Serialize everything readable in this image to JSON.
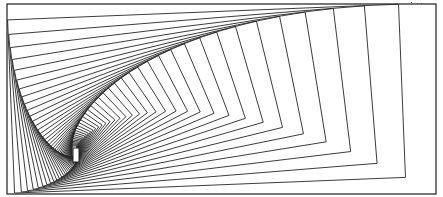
{
  "figure": {
    "canvas": {
      "width": 443,
      "height": 197,
      "background": "#ffffff"
    },
    "stroke_color": "#262626",
    "outer_rectangle": {
      "x1": 7,
      "y1": 4,
      "x2": 436,
      "y2": 194
    },
    "spiral": {
      "center": [
        76,
        155
      ],
      "scale_per_step": 0.912,
      "rotation_deg_per_step": -2.3,
      "steps": 40
    },
    "innermost_rectangle": {
      "x": 73,
      "y": 148,
      "width": 6,
      "height": 14
    },
    "marks": [
      {
        "x": 411,
        "y": 2
      },
      {
        "x": 417,
        "y": 3
      },
      {
        "x": 421,
        "y": 3
      }
    ]
  }
}
